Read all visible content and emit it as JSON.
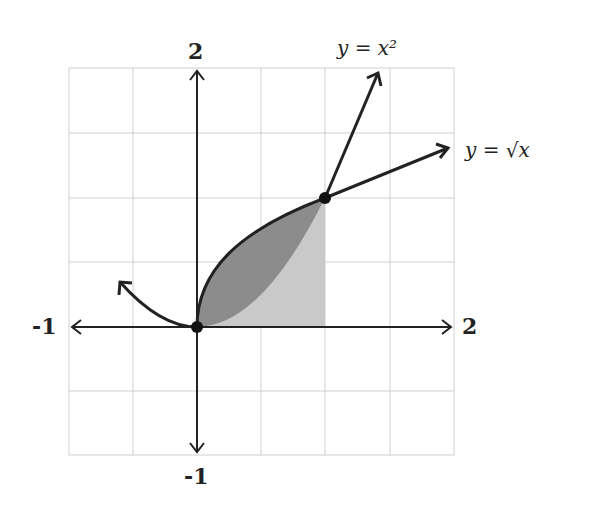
{
  "figure": {
    "axis_labels": {
      "y_top": "2",
      "y_bottom": "-1",
      "x_left": "-1",
      "x_right": "2"
    },
    "curves": [
      {
        "name": "parabola",
        "label": "y = x²"
      },
      {
        "name": "sqrt",
        "label": "y = √x"
      }
    ],
    "points": [
      {
        "x": 0,
        "y": 0
      },
      {
        "x": 1,
        "y": 1
      }
    ],
    "regions": {
      "between_curves_color": "#8c8c8c",
      "under_parabola_color": "#c9c9c9"
    },
    "grid": {
      "x_range": [
        -1,
        2
      ],
      "y_range": [
        -1,
        2
      ],
      "step": 0.5
    }
  }
}
